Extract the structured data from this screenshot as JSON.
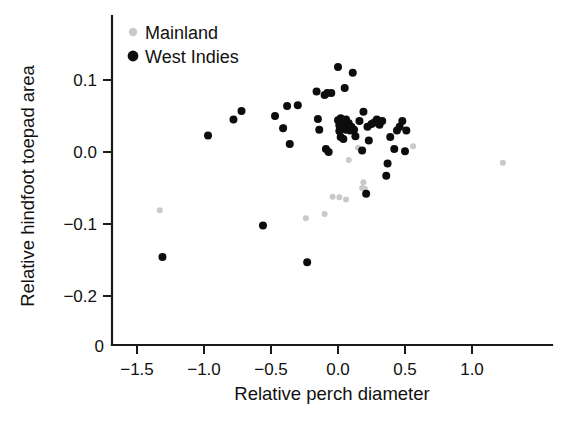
{
  "chart_data": {
    "type": "scatter",
    "title": "",
    "xlabel": "Relative perch diameter",
    "ylabel": "Relative hindfoot toepad area",
    "xlim": [
      -1.72,
      1.42
    ],
    "ylim": [
      -0.272,
      0.143
    ],
    "xticks": [
      -1.5,
      -1.0,
      -0.5,
      0.0,
      0.5,
      1.0
    ],
    "xticklabels": [
      "−1.5",
      "−1.0",
      "−0.5",
      "0.0",
      "0.5",
      "1.0"
    ],
    "yticks": [
      0.1,
      0.0,
      -0.1,
      -0.2
    ],
    "yticklabels": [
      "0.1",
      "0.0",
      "−0.1",
      "−0.2"
    ],
    "origin_label": "0",
    "grid": false,
    "legend_position": "top-left",
    "series": [
      {
        "name": "Mainland",
        "color": "#c9c9c9",
        "marker": "circle",
        "marker_size": 6,
        "points": [
          [
            -1.33,
            -0.081
          ],
          [
            -0.4,
            0.035
          ],
          [
            -0.24,
            -0.092
          ],
          [
            -0.1,
            -0.086
          ],
          [
            -0.04,
            -0.062
          ],
          [
            0.01,
            -0.063
          ],
          [
            0.06,
            -0.066
          ],
          [
            0.08,
            -0.011
          ],
          [
            0.15,
            0.006
          ],
          [
            0.18,
            -0.05
          ],
          [
            0.19,
            -0.042
          ],
          [
            0.2,
            -0.051
          ],
          [
            0.56,
            0.008
          ],
          [
            1.23,
            -0.015
          ]
        ]
      },
      {
        "name": "West Indies",
        "color": "#0d0d0d",
        "marker": "circle",
        "marker_size": 8,
        "points": [
          [
            -1.31,
            -0.146
          ],
          [
            -0.97,
            0.023
          ],
          [
            -0.78,
            0.045
          ],
          [
            -0.72,
            0.057
          ],
          [
            -0.56,
            -0.102
          ],
          [
            -0.47,
            0.05
          ],
          [
            -0.41,
            0.033
          ],
          [
            -0.38,
            0.064
          ],
          [
            -0.36,
            0.011
          ],
          [
            -0.3,
            0.065
          ],
          [
            -0.23,
            -0.153
          ],
          [
            -0.16,
            0.084
          ],
          [
            -0.15,
            0.046
          ],
          [
            -0.14,
            0.031
          ],
          [
            -0.1,
            0.079
          ],
          [
            -0.09,
            0.004
          ],
          [
            -0.08,
            0.082
          ],
          [
            -0.07,
            0.0
          ],
          [
            -0.05,
            0.082
          ],
          [
            0.0,
            0.118
          ],
          [
            0.0,
            0.044
          ],
          [
            0.01,
            0.037
          ],
          [
            0.01,
            0.029
          ],
          [
            0.02,
            0.047
          ],
          [
            0.02,
            0.021
          ],
          [
            0.03,
            0.033
          ],
          [
            0.03,
            0.041
          ],
          [
            0.04,
            0.018
          ],
          [
            0.05,
            0.089
          ],
          [
            0.05,
            0.036
          ],
          [
            0.06,
            0.031
          ],
          [
            0.06,
            0.045
          ],
          [
            0.07,
            0.034
          ],
          [
            0.08,
            0.04
          ],
          [
            0.09,
            0.03
          ],
          [
            0.1,
            0.035
          ],
          [
            0.11,
            0.11
          ],
          [
            0.12,
            0.031
          ],
          [
            0.13,
            0.022
          ],
          [
            0.16,
            0.043
          ],
          [
            0.18,
            0.002
          ],
          [
            0.19,
            0.056
          ],
          [
            0.21,
            -0.058
          ],
          [
            0.22,
            0.035
          ],
          [
            0.23,
            0.016
          ],
          [
            0.25,
            0.039
          ],
          [
            0.27,
            0.041
          ],
          [
            0.29,
            0.045
          ],
          [
            0.31,
            0.038
          ],
          [
            0.33,
            0.043
          ],
          [
            0.36,
            -0.033
          ],
          [
            0.37,
            -0.016
          ],
          [
            0.39,
            0.021
          ],
          [
            0.42,
            0.004
          ],
          [
            0.44,
            0.03
          ],
          [
            0.46,
            0.035
          ],
          [
            0.48,
            0.043
          ],
          [
            0.5,
            0.001
          ],
          [
            0.51,
            0.03
          ]
        ]
      }
    ]
  },
  "legend": {
    "items": [
      {
        "label": "Mainland",
        "color": "#c9c9c9",
        "radius": 4.2
      },
      {
        "label": "West Indies",
        "color": "#0d0d0d",
        "radius": 5.4
      }
    ]
  },
  "axes": {
    "x_title": "Relative perch diameter",
    "y_title": "Relative hindfoot toepad area",
    "origin": "0"
  }
}
